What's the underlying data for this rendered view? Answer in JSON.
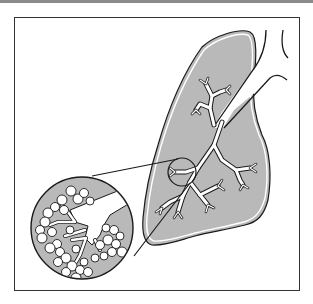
{
  "figure": {
    "labels": [],
    "colors": {
      "lung_fill": "#b9b9b9",
      "outline": "#1a1a1a",
      "airway_fill": "#ffffff",
      "frame": "#333333",
      "top_bar": "#8a8a8a"
    },
    "parts": [
      {
        "id": "lung",
        "name": "Lung"
      },
      {
        "id": "trachea",
        "name": "Trachea"
      },
      {
        "id": "bronchial-tree",
        "name": "Bronchial tree"
      },
      {
        "id": "detail-circle",
        "name": "Magnified region marker"
      },
      {
        "id": "alveoli-inset",
        "name": "Alveoli inset (magnified)"
      }
    ]
  }
}
